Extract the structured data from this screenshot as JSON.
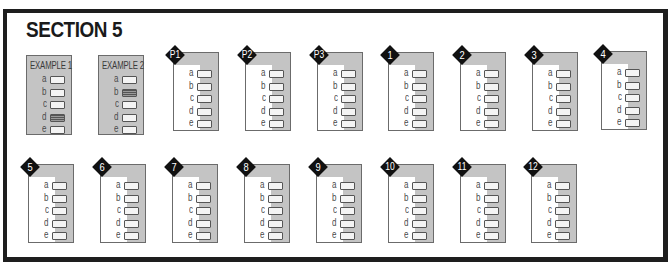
{
  "section": {
    "title": "SECTION 5"
  },
  "colors": {
    "box_gray": "#c4c4c4",
    "frame": "#1e1e1e",
    "diamond": "#111111"
  },
  "letters": [
    "a",
    "b",
    "c",
    "d",
    "e"
  ],
  "examples": [
    {
      "label": "EXAMPLE 1",
      "filled": "d"
    },
    {
      "label": "EXAMPLE 2",
      "filled": "b"
    }
  ],
  "questions": [
    {
      "label": "P1"
    },
    {
      "label": "P2"
    },
    {
      "label": "P3"
    },
    {
      "label": "1"
    },
    {
      "label": "2"
    },
    {
      "label": "3"
    },
    {
      "label": "4"
    },
    {
      "label": "5"
    },
    {
      "label": "6"
    },
    {
      "label": "7"
    },
    {
      "label": "8"
    },
    {
      "label": "9"
    },
    {
      "label": "10"
    },
    {
      "label": "11"
    },
    {
      "label": "12"
    }
  ]
}
